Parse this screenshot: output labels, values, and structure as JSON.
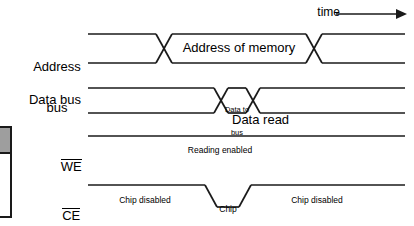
{
  "figure": {
    "type": "timing-diagram",
    "time_axis": {
      "label": "time",
      "arrow": "right-arrow",
      "direction": "left-to-right"
    },
    "signals": [
      {
        "id": "address-bus",
        "label_line1": "Address",
        "label_line2": "bus",
        "label": "Address bus",
        "style": "bus",
        "overline": false,
        "annotation": "Address of memory",
        "segments": [
          {
            "state": "valid-unknown",
            "text": ""
          },
          {
            "state": "valid-data",
            "text": "Address of memory"
          },
          {
            "state": "valid-unknown",
            "text": ""
          }
        ]
      },
      {
        "id": "data-bus",
        "label_line1": "Data bus",
        "label_line2": "",
        "label": "Data bus",
        "style": "bus",
        "overline": false,
        "annotation": "Data to bus",
        "annotation2": "Data read",
        "segments": [
          {
            "state": "valid-unknown",
            "text": ""
          },
          {
            "state": "valid-data",
            "text": "Data to bus"
          },
          {
            "state": "valid-unknown",
            "text": ""
          }
        ]
      },
      {
        "id": "we",
        "label_line1": "WE",
        "label_line2": "",
        "label": "WE",
        "style": "level",
        "overline": true,
        "annotation": "Reading enabled",
        "level": "high"
      },
      {
        "id": "ce",
        "label_line1": "CE",
        "label_line2": "",
        "label": "CE",
        "style": "level",
        "overline": true,
        "annotation_left": "Chip disabled",
        "annotation_mid_line1": "Chip",
        "annotation_mid_line2": "enabled",
        "annotation_right": "Chip disabled",
        "level": "high-low-high"
      }
    ],
    "colors": {
      "line": "#1a1a1a",
      "text": "#000000",
      "background": "#ffffff",
      "box_fill": "#9e9e9e"
    }
  },
  "left_artifact": {
    "name": "cropped-table-edge",
    "visible": true
  }
}
